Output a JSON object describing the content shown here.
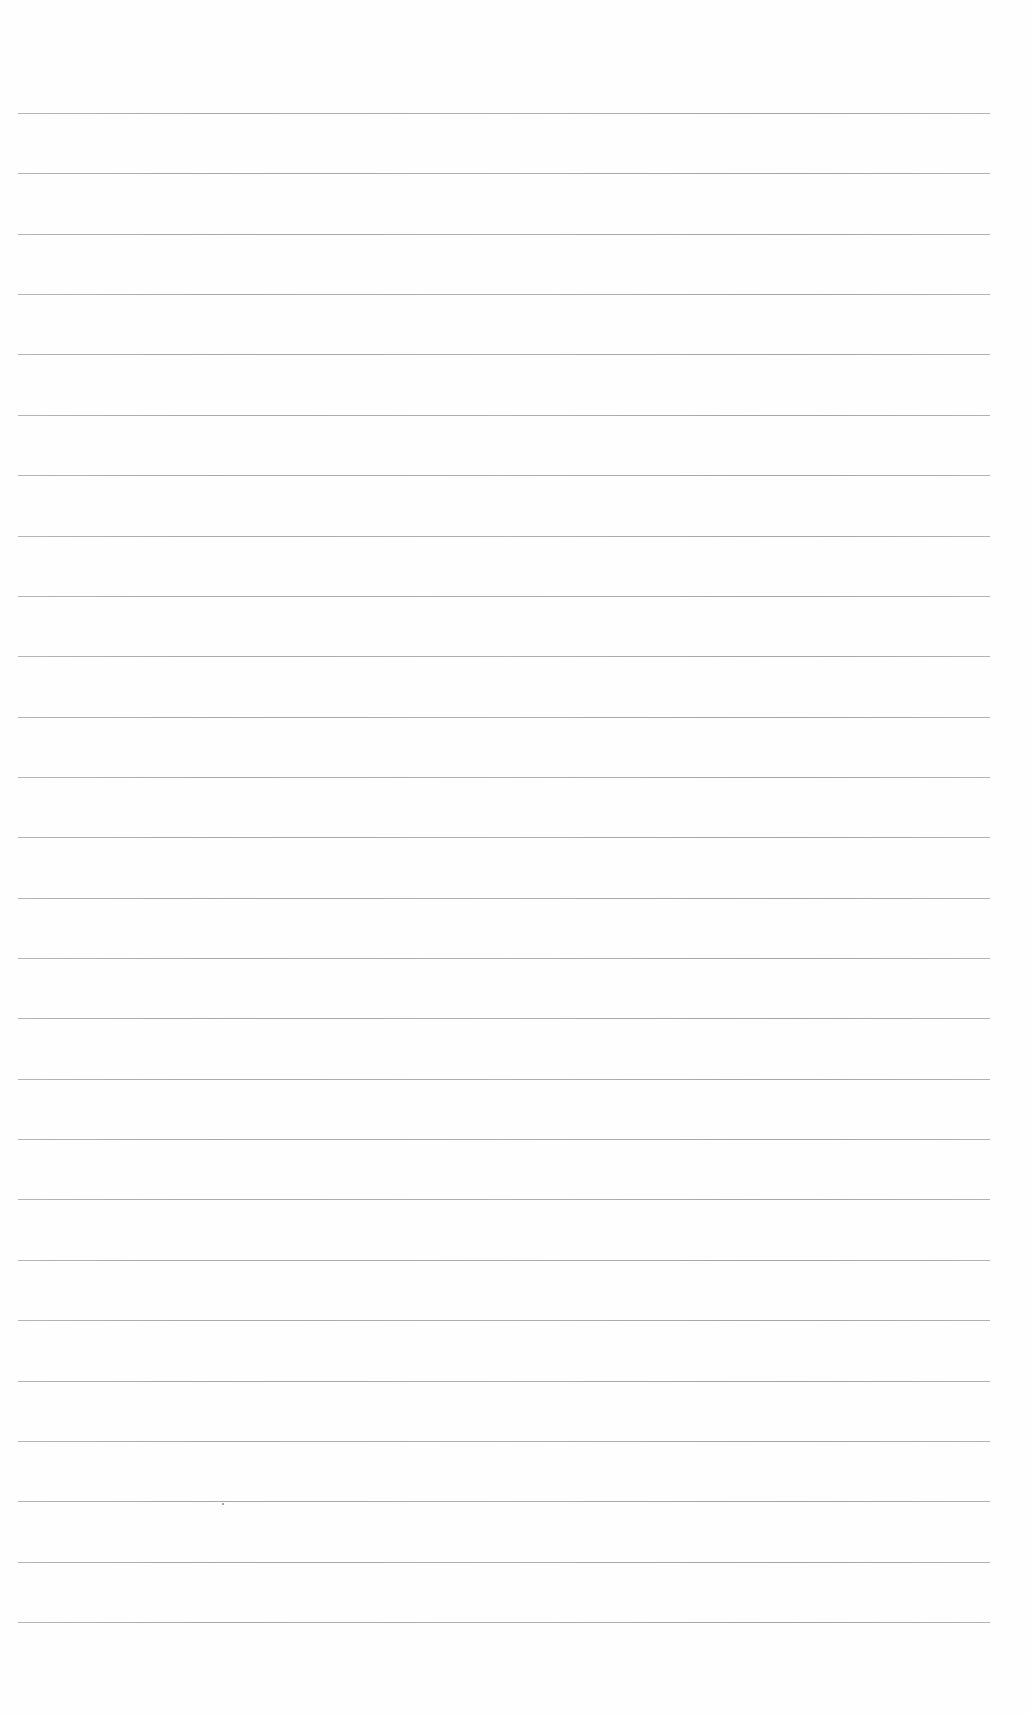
{
  "page": {
    "type": "ruled-paper",
    "background_color": "#fefefe",
    "rule_color": "#9a9a9a",
    "rule_count": 26,
    "rule_left": 18,
    "rule_width": 972,
    "first_rule_y": 113,
    "rule_spacing": 60.36
  },
  "specks": [
    {
      "x": 222,
      "y": 1503
    }
  ]
}
